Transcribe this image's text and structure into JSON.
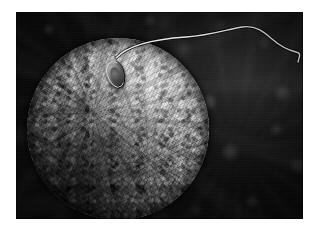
{
  "image": {
    "kind": "scanning-electron-micrograph",
    "subject": "sperm cell attached to an ovum (egg cell)",
    "palette": {
      "paper": "#ffffff",
      "background_dark": "#0a0a0a",
      "background_mottle": "#2a2a2a",
      "egg_highlight": "#c9c9c9",
      "egg_midtone": "#818181",
      "egg_shadow": "#171717",
      "sperm_head_highlight": "#b9b9b9",
      "sperm_tail": "#e8e8e8"
    },
    "frame": {
      "left": 16,
      "top": 12,
      "width": 287,
      "height": 207,
      "border_color": "#ffffff"
    },
    "objects": {
      "egg": {
        "label": "ovum",
        "center_x": 102,
        "center_y": 117,
        "radius": 91,
        "surface": "rough granular microvilli texture",
        "light_direction": "upper-right"
      },
      "sperm_head": {
        "label": "sperm head",
        "center_x": 99,
        "center_y": 62,
        "width": 19,
        "height": 29,
        "rotation_deg": -18
      },
      "sperm_tail": {
        "label": "flagellum",
        "stroke_color": "#e8e8e8",
        "stroke_width": 1.4,
        "path": "M 100 46 C 112 33, 140 27, 170 25 C 196 23, 212 17, 226 15 C 240 13, 248 20, 256 27 C 264 34, 272 38, 280 40 C 286 41, 283 45, 282 50"
      }
    }
  }
}
